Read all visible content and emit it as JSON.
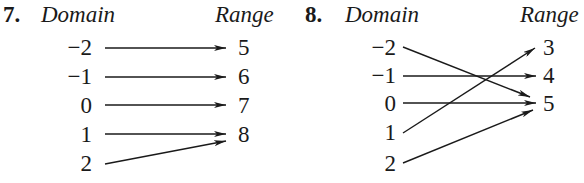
{
  "problems": [
    {
      "number": "7.",
      "domain_header": "Domain",
      "range_header": "Range",
      "domain": [
        "−2",
        "−1",
        "0",
        "1",
        "2"
      ],
      "range": [
        "5",
        "6",
        "7",
        "8"
      ],
      "mapping": [
        [
          "−2",
          "5"
        ],
        [
          "−1",
          "6"
        ],
        [
          "0",
          "7"
        ],
        [
          "1",
          "8"
        ],
        [
          "2",
          "8"
        ]
      ]
    },
    {
      "number": "8.",
      "domain_header": "Domain",
      "range_header": "Range",
      "domain": [
        "−2",
        "−1",
        "0",
        "1",
        "2"
      ],
      "range": [
        "3",
        "4",
        "5"
      ],
      "mapping": [
        [
          "−2",
          "5"
        ],
        [
          "−1",
          "4"
        ],
        [
          "0",
          "5"
        ],
        [
          "1",
          "3"
        ],
        [
          "2",
          "5"
        ]
      ]
    }
  ]
}
